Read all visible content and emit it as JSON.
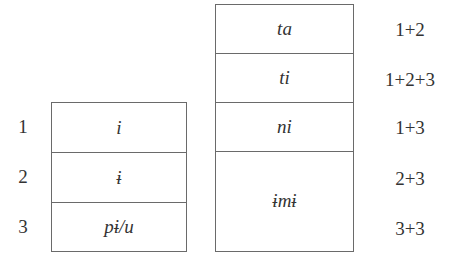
{
  "left_table": {
    "rows": [
      {
        "number": "1",
        "form": "i"
      },
      {
        "number": "2",
        "form": "ɨ"
      },
      {
        "number": "3",
        "form": "pɨ/u"
      }
    ]
  },
  "right_table": {
    "rows": [
      {
        "form": "ta",
        "combination": "1+2"
      },
      {
        "form": "ti",
        "combination": "1+2+3"
      },
      {
        "form": "ni",
        "combination": "1+3"
      },
      {
        "form": "ɨmɨ",
        "combinations": [
          "2+3",
          "3+3"
        ]
      }
    ]
  }
}
